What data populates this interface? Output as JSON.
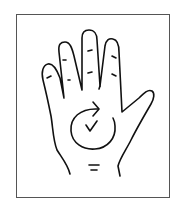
{
  "illustration": {
    "subject": "open palm of hand with circular arrow",
    "caption": "Rub palm in a circular motion",
    "colors": {
      "stroke": "#111111",
      "frame": "#555555",
      "background": "#ffffff"
    },
    "icons": [
      "hand-palm-icon",
      "circular-arrow-icon"
    ]
  }
}
